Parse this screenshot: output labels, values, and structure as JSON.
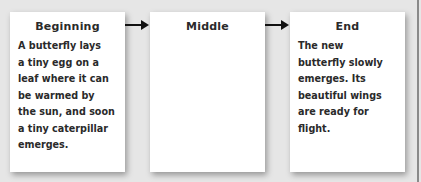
{
  "diagram": {
    "boxes": [
      {
        "title": "Beginning",
        "text": "A butterfly lays\na tiny egg on a\nleaf where it can\nbe warmed by\nthe sun, and soon\na tiny caterpillar\nemerges."
      },
      {
        "title": "Middle",
        "text": ""
      },
      {
        "title": "End",
        "text": "The new\nbutterfly slowly\nemerges. Its\nbeautiful wings\nare ready for\nflight."
      }
    ],
    "arrows": [
      {
        "from": "Beginning",
        "to": "Middle"
      },
      {
        "from": "Middle",
        "to": "End"
      }
    ],
    "colors": {
      "background": "#e6e6e6",
      "box": "#ffffff",
      "text": "#2a2a2a",
      "arrow": "#111111"
    }
  }
}
